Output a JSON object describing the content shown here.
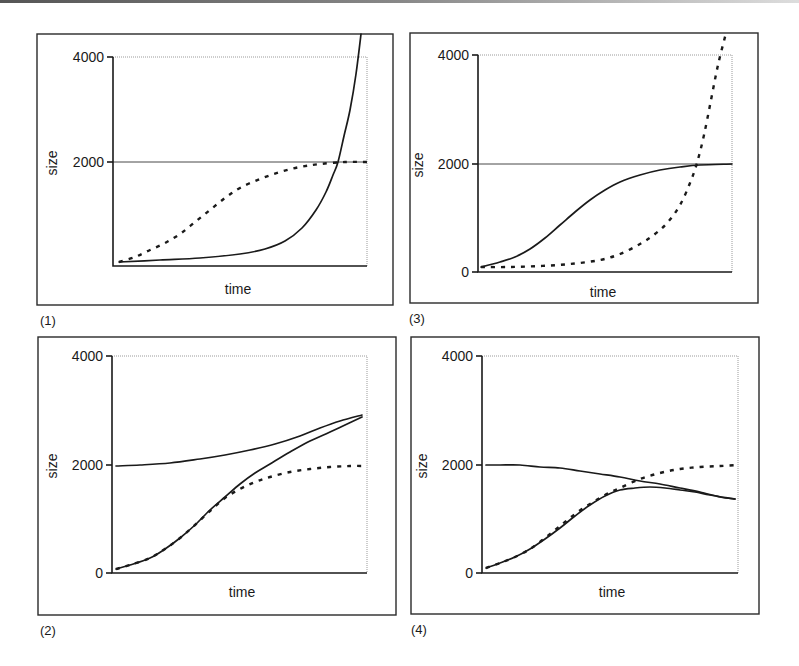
{
  "figure": {
    "panel_count": 4,
    "line_color": "#1a1a1a",
    "background": "#ffffff"
  },
  "panels": [
    {
      "id": "1",
      "label": "(1)",
      "xlabel": "time",
      "ylabel": "size",
      "yticks": [
        "4000",
        "2000"
      ],
      "frame": [
        37,
        34,
        356,
        271
      ],
      "plot": {
        "x0": 113,
        "x1": 367,
        "y0": 266,
        "y4000": 57,
        "y2000": 162
      },
      "ticks": [
        {
          "label": "4000",
          "y": 57
        },
        {
          "label": "2000",
          "y": 162
        }
      ],
      "refline_y": 162,
      "curves": [
        {
          "style": "solid",
          "name": "population (exponential)",
          "points": [
            [
              119,
              262
            ],
            [
              160,
              260
            ],
            [
              200,
              258
            ],
            [
              240,
              254
            ],
            [
              265,
              249
            ],
            [
              285,
              241
            ],
            [
              302,
              228
            ],
            [
              316,
              210
            ],
            [
              326,
              192
            ],
            [
              333,
              175
            ],
            [
              338,
              162
            ],
            [
              344,
              136
            ],
            [
              350,
              110
            ],
            [
              356,
              74
            ],
            [
              361,
              34
            ]
          ]
        },
        {
          "style": "dotted",
          "name": "logistic reference",
          "points": [
            [
              119,
              262
            ],
            [
              135,
              257
            ],
            [
              150,
              250
            ],
            [
              165,
              243
            ],
            [
              180,
              234
            ],
            [
              195,
              222
            ],
            [
              210,
              210
            ],
            [
              225,
              198
            ],
            [
              240,
              188
            ],
            [
              260,
              179
            ],
            [
              280,
              172
            ],
            [
              300,
              167
            ],
            [
              320,
              164
            ],
            [
              345,
              162
            ],
            [
              367,
              162
            ]
          ]
        }
      ],
      "plabel_pos": [
        40,
        325
      ],
      "xlabel_pos": [
        238,
        294
      ],
      "ylabel_pos": [
        52,
        163
      ]
    },
    {
      "id": "3",
      "label": "(3)",
      "xlabel": "time",
      "ylabel": "size",
      "yticks": [
        "4000",
        "2000",
        "0"
      ],
      "frame": [
        410,
        33,
        348,
        270
      ],
      "plot": {
        "x0": 478,
        "x1": 732,
        "y0": 272,
        "y4000": 55,
        "y2000": 164
      },
      "ticks": [
        {
          "label": "4000",
          "y": 55
        },
        {
          "label": "2000",
          "y": 164
        },
        {
          "label": "0",
          "y": 272
        }
      ],
      "refline_y": 164,
      "curves": [
        {
          "style": "solid",
          "name": "population (logistic)",
          "points": [
            [
              481,
              267
            ],
            [
              500,
              262
            ],
            [
              515,
              257
            ],
            [
              530,
              249
            ],
            [
              545,
              238
            ],
            [
              560,
              225
            ],
            [
              575,
              212
            ],
            [
              590,
              200
            ],
            [
              605,
              190
            ],
            [
              620,
              182
            ],
            [
              640,
              175
            ],
            [
              660,
              170
            ],
            [
              680,
              167
            ],
            [
              700,
              165
            ],
            [
              732,
              164
            ]
          ]
        },
        {
          "style": "dotted",
          "name": "exponential reference",
          "points": [
            [
              481,
              267
            ],
            [
              510,
              267
            ],
            [
              540,
              266
            ],
            [
              570,
              264
            ],
            [
              600,
              260
            ],
            [
              620,
              254
            ],
            [
              640,
              244
            ],
            [
              655,
              234
            ],
            [
              668,
              222
            ],
            [
              680,
              205
            ],
            [
              690,
              183
            ],
            [
              697,
              163
            ],
            [
              704,
              135
            ],
            [
              711,
              100
            ],
            [
              718,
              65
            ],
            [
              726,
              33
            ]
          ]
        }
      ],
      "plabel_pos": [
        409,
        323
      ],
      "xlabel_pos": [
        603,
        297
      ],
      "ylabel_pos": [
        418,
        165
      ]
    },
    {
      "id": "2",
      "label": "(2)",
      "xlabel": "time",
      "ylabel": "size",
      "yticks": [
        "4000",
        "2000",
        "0"
      ],
      "frame": [
        38,
        337,
        358,
        278
      ],
      "plot": {
        "x0": 112,
        "x1": 367,
        "y0": 573,
        "y4000": 356,
        "y2000": 465
      },
      "ticks": [
        {
          "label": "4000",
          "y": 356
        },
        {
          "label": "2000",
          "y": 465
        },
        {
          "label": "0",
          "y": 573
        }
      ],
      "refline_y": null,
      "curves": [
        {
          "style": "solid",
          "name": "carrying capacity (rising)",
          "points": [
            [
              116,
              466
            ],
            [
              140,
              465
            ],
            [
              170,
              463
            ],
            [
              200,
              459
            ],
            [
              225,
              455
            ],
            [
              250,
              450
            ],
            [
              275,
              444
            ],
            [
              300,
              436
            ],
            [
              320,
              428
            ],
            [
              340,
              421
            ],
            [
              362,
              415
            ]
          ]
        },
        {
          "style": "solid",
          "name": "population",
          "points": [
            [
              116,
              569
            ],
            [
              130,
              565
            ],
            [
              150,
              558
            ],
            [
              165,
              549
            ],
            [
              180,
              538
            ],
            [
              195,
              525
            ],
            [
              210,
              510
            ],
            [
              225,
              497
            ],
            [
              240,
              484
            ],
            [
              255,
              473
            ],
            [
              270,
              464
            ],
            [
              290,
              452
            ],
            [
              310,
              441
            ],
            [
              330,
              432
            ],
            [
              345,
              425
            ],
            [
              362,
              417
            ]
          ]
        },
        {
          "style": "dotted",
          "name": "logistic reference",
          "points": [
            [
              116,
              569
            ],
            [
              130,
              565
            ],
            [
              150,
              558
            ],
            [
              165,
              549
            ],
            [
              180,
              538
            ],
            [
              195,
              525
            ],
            [
              210,
              511
            ],
            [
              225,
              498
            ],
            [
              240,
              489
            ],
            [
              255,
              482
            ],
            [
              270,
              477
            ],
            [
              290,
              472
            ],
            [
              310,
              469
            ],
            [
              330,
              467
            ],
            [
              350,
              466
            ],
            [
              367,
              466
            ]
          ]
        }
      ],
      "plabel_pos": [
        40,
        635
      ],
      "xlabel_pos": [
        242,
        597
      ],
      "ylabel_pos": [
        52,
        466
      ]
    },
    {
      "id": "4",
      "label": "(4)",
      "xlabel": "time",
      "ylabel": "size",
      "yticks": [
        "4000",
        "2000",
        "0"
      ],
      "frame": [
        411,
        337,
        348,
        277
      ],
      "plot": {
        "x0": 482,
        "x1": 738,
        "y0": 573,
        "y4000": 356,
        "y2000": 465
      },
      "ticks": [
        {
          "label": "4000",
          "y": 356
        },
        {
          "label": "2000",
          "y": 465
        },
        {
          "label": "0",
          "y": 573
        }
      ],
      "refline_y": null,
      "curves": [
        {
          "style": "solid",
          "name": "carrying capacity (declining)",
          "points": [
            [
              486,
              465
            ],
            [
              500,
              465
            ],
            [
              520,
              465
            ],
            [
              540,
              467
            ],
            [
              560,
              468
            ],
            [
              580,
              471
            ],
            [
              600,
              474
            ],
            [
              620,
              477
            ],
            [
              640,
              481
            ],
            [
              660,
              484
            ],
            [
              680,
              488
            ],
            [
              700,
              492
            ],
            [
              720,
              497
            ],
            [
              735,
              499
            ]
          ]
        },
        {
          "style": "solid",
          "name": "population",
          "points": [
            [
              486,
              568
            ],
            [
              500,
              563
            ],
            [
              515,
              557
            ],
            [
              530,
              549
            ],
            [
              545,
              539
            ],
            [
              560,
              528
            ],
            [
              575,
              516
            ],
            [
              590,
              505
            ],
            [
              605,
              496
            ],
            [
              620,
              490
            ],
            [
              635,
              488
            ],
            [
              650,
              487
            ],
            [
              665,
              488
            ],
            [
              680,
              490
            ],
            [
              695,
              492
            ],
            [
              710,
              495
            ],
            [
              735,
              499
            ]
          ]
        },
        {
          "style": "dotted",
          "name": "logistic reference",
          "points": [
            [
              486,
              568
            ],
            [
              500,
              563
            ],
            [
              515,
              557
            ],
            [
              530,
              549
            ],
            [
              545,
              538
            ],
            [
              560,
              526
            ],
            [
              575,
              514
            ],
            [
              590,
              504
            ],
            [
              605,
              495
            ],
            [
              620,
              488
            ],
            [
              640,
              479
            ],
            [
              660,
              473
            ],
            [
              680,
              469
            ],
            [
              700,
              467
            ],
            [
              720,
              466
            ],
            [
              738,
              465
            ]
          ]
        }
      ],
      "plabel_pos": [
        411,
        634
      ],
      "xlabel_pos": [
        612,
        597
      ],
      "ylabel_pos": [
        422,
        466
      ]
    }
  ],
  "chart_data": [
    {
      "type": "line",
      "title": "(1)",
      "xlabel": "time",
      "ylabel": "size",
      "ylim": [
        0,
        4000
      ],
      "yticks": [
        2000,
        4000
      ],
      "grid": false,
      "x": [
        0,
        0.1,
        0.2,
        0.3,
        0.4,
        0.5,
        0.6,
        0.7,
        0.8,
        0.9,
        0.97
      ],
      "series": [
        {
          "name": "solid (exponential growth)",
          "values": [
            80,
            90,
            110,
            150,
            210,
            300,
            450,
            800,
            1500,
            3000,
            4400
          ]
        },
        {
          "name": "dotted (logistic, K=2000)",
          "values": [
            80,
            250,
            480,
            800,
            1150,
            1450,
            1700,
            1850,
            1950,
            1990,
            2000
          ]
        }
      ],
      "annotations": [
        "horizontal line at size=2000"
      ]
    },
    {
      "type": "line",
      "title": "(3)",
      "xlabel": "time",
      "ylabel": "size",
      "ylim": [
        0,
        4000
      ],
      "yticks": [
        0,
        2000,
        4000
      ],
      "grid": false,
      "x": [
        0,
        0.1,
        0.2,
        0.3,
        0.4,
        0.5,
        0.6,
        0.7,
        0.8,
        0.9,
        0.97
      ],
      "series": [
        {
          "name": "solid (logistic, K=2000)",
          "values": [
            90,
            260,
            550,
            950,
            1350,
            1650,
            1830,
            1930,
            1970,
            1990,
            2000
          ]
        },
        {
          "name": "dotted (exponential growth)",
          "values": [
            90,
            90,
            110,
            150,
            230,
            350,
            550,
            900,
            1500,
            2600,
            4400
          ]
        }
      ],
      "annotations": [
        "horizontal line at size=2000"
      ]
    },
    {
      "type": "line",
      "title": "(2)",
      "xlabel": "time",
      "ylabel": "size",
      "ylim": [
        0,
        4000
      ],
      "yticks": [
        0,
        2000,
        4000
      ],
      "grid": false,
      "x": [
        0,
        0.1,
        0.2,
        0.3,
        0.4,
        0.5,
        0.6,
        0.7,
        0.8,
        0.9,
        1.0
      ],
      "series": [
        {
          "name": "solid upper (rising carrying capacity)",
          "values": [
            2000,
            2020,
            2060,
            2110,
            2180,
            2260,
            2360,
            2480,
            2620,
            2780,
            2900
          ]
        },
        {
          "name": "solid lower (population)",
          "values": [
            90,
            250,
            520,
            900,
            1300,
            1700,
            2050,
            2330,
            2550,
            2750,
            2870
          ]
        },
        {
          "name": "dotted (logistic, K=2000)",
          "values": [
            90,
            250,
            520,
            900,
            1250,
            1530,
            1720,
            1840,
            1920,
            1970,
            1990
          ]
        }
      ]
    },
    {
      "type": "line",
      "title": "(4)",
      "xlabel": "time",
      "ylabel": "size",
      "ylim": [
        0,
        4000
      ],
      "yticks": [
        0,
        2000,
        4000
      ],
      "grid": false,
      "x": [
        0,
        0.1,
        0.2,
        0.3,
        0.4,
        0.5,
        0.6,
        0.7,
        0.8,
        0.9,
        1.0
      ],
      "series": [
        {
          "name": "solid upper (declining carrying capacity)",
          "values": [
            2000,
            2000,
            1980,
            1950,
            1910,
            1860,
            1800,
            1740,
            1670,
            1590,
            1380
          ]
        },
        {
          "name": "solid lower (population)",
          "values": [
            100,
            280,
            560,
            950,
            1300,
            1480,
            1540,
            1530,
            1500,
            1460,
            1380
          ]
        },
        {
          "name": "dotted (logistic, K=2000)",
          "values": [
            100,
            280,
            560,
            960,
            1350,
            1640,
            1820,
            1910,
            1960,
            1985,
            2000
          ]
        }
      ]
    }
  ]
}
